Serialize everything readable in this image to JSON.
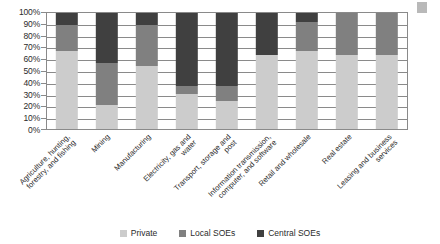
{
  "chart_data": {
    "type": "bar",
    "subtype": "stacked-100-percent",
    "title": "",
    "xlabel": "",
    "ylabel": "",
    "ylim": [
      0,
      100
    ],
    "y_unit": "%",
    "grid": true,
    "legend_position": "bottom",
    "orientation": "vertical",
    "y_ticks": [
      "0%",
      "10%",
      "20%",
      "30%",
      "40%",
      "50%",
      "60%",
      "70%",
      "80%",
      "90%",
      "100%"
    ],
    "y_tick_values": [
      0,
      10,
      20,
      30,
      40,
      50,
      60,
      70,
      80,
      90,
      100
    ],
    "categories": [
      "Agriculture, hunting, forestry, and fishing",
      "Mining",
      "Manufacturing",
      "Electricity, gas and water",
      "Transport, storage and post",
      "Information transmission, computer, and software",
      "Retail and wholesale",
      "Real estate",
      "Leasing and business services"
    ],
    "category_label_lines": [
      [
        "Agriculture, hunting,",
        "forestry, and fishing"
      ],
      [
        "Mining"
      ],
      [
        "Manufacturing"
      ],
      [
        "Electricity, gas and",
        "water"
      ],
      [
        "Transport, storage and",
        "post"
      ],
      [
        "Information transmission,",
        "computer, and software"
      ],
      [
        "Retail and wholesale"
      ],
      [
        "Real estate"
      ],
      [
        "Leasing and business",
        "services"
      ]
    ],
    "series": [
      {
        "name": "Private",
        "color": "#cccccc",
        "values": [
          67,
          21,
          54,
          30,
          24,
          64,
          67,
          64,
          64
        ]
      },
      {
        "name": "Local SOEs",
        "color": "#808080",
        "values": [
          23,
          36,
          36,
          7,
          13,
          0,
          25,
          36,
          36
        ]
      },
      {
        "name": "Central SOEs",
        "color": "#404040",
        "values": [
          10,
          43,
          10,
          63,
          63,
          36,
          8,
          0,
          0
        ]
      }
    ]
  },
  "legend": {
    "items": [
      {
        "label": "Private",
        "color": "#cccccc"
      },
      {
        "label": "Local SOEs",
        "color": "#808080"
      },
      {
        "label": "Central SOEs",
        "color": "#404040"
      }
    ]
  }
}
